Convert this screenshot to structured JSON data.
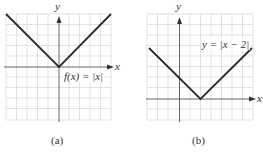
{
  "figures": [
    {
      "id": "a",
      "caption": "(a)",
      "function_label": "f(x) = |x|",
      "x_axis_label": "x",
      "y_axis_label": "y",
      "vertex": [
        0,
        0
      ]
    },
    {
      "id": "b",
      "caption": "(b)",
      "function_label": "y = |x − 2|",
      "x_axis_label": "x",
      "y_axis_label": "y",
      "vertex": [
        2,
        0
      ]
    }
  ],
  "colors": {
    "grid": "#d4d4d4",
    "axis": "#444444",
    "curve": "#2b2b2b"
  }
}
